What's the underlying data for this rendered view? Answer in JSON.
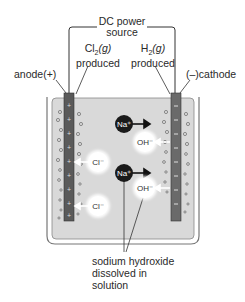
{
  "diagram": {
    "power": {
      "line1": "DC power",
      "line2": "source"
    },
    "anode_gas": {
      "formula": "Cl",
      "subscript": "2",
      "state": "(g)",
      "word": "produced"
    },
    "cathode_gas": {
      "formula": "H",
      "subscript": "2",
      "state": "(g)",
      "word": "produced"
    },
    "anode_label": "anode(+)",
    "cathode_label": "(–)cathode",
    "ions": {
      "na1": "Na⁺",
      "na2": "Na⁺",
      "oh1": "OH⁻",
      "oh2": "OH⁻",
      "cl1": "Cl⁻",
      "cl2": "Cl⁻"
    },
    "product": {
      "line1": "sodium hydroxide",
      "line2": "dissolved in",
      "line3": "solution"
    },
    "colors": {
      "solution": "#d8d8d8",
      "electrode": "#5a5a5a",
      "beaker": "#7a7a7a",
      "line": "#333333"
    }
  }
}
